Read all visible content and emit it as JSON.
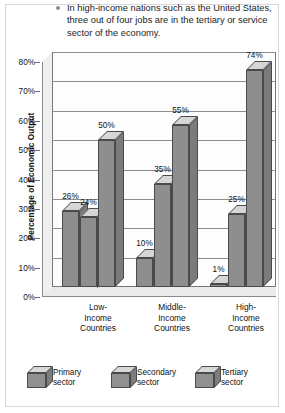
{
  "caption": {
    "bullet_icon": "bullet-dot-icon",
    "text": "In high-income nations such as the United States, three out of four jobs are in the tertiary or service sector of the economy."
  },
  "chart_data": {
    "type": "bar",
    "title": "",
    "xlabel": "",
    "ylabel": "Percentage of Economic Output",
    "ylim": [
      0,
      80
    ],
    "yticks": [
      "0%",
      "10%",
      "20%",
      "30%",
      "40%",
      "50%",
      "60%",
      "70%",
      "80%"
    ],
    "grid": true,
    "legend_position": "bottom",
    "categories": [
      "Low-\nIncome\nCountries",
      "Middle-\nIncome\nCountries",
      "High-\nIncome\nCountries"
    ],
    "category_lines": [
      [
        "Low-",
        "Income",
        "Countries"
      ],
      [
        "Middle-",
        "Income",
        "Countries"
      ],
      [
        "High-",
        "Income",
        "Countries"
      ]
    ],
    "series": [
      {
        "name": "Primary sector",
        "values": [
          26,
          10,
          1
        ],
        "labels": [
          "26%",
          "10%",
          "1%"
        ]
      },
      {
        "name": "Secondary sector",
        "values": [
          24,
          35,
          25
        ],
        "labels": [
          "24%",
          "35%",
          "25%"
        ]
      },
      {
        "name": "Tertiary sector",
        "values": [
          50,
          55,
          74
        ],
        "labels": [
          "50%",
          "55%",
          "74%"
        ]
      }
    ],
    "colors": {
      "bar_front": "#8e8e8e",
      "bar_top": "#d6d6d6",
      "bar_side": "#7b7b7b",
      "bar_edge": "#4a4a4a",
      "plot_background": "#fdfdfd",
      "gridline": "#8d8d8d"
    }
  },
  "legend": {
    "items": [
      {
        "label_line1": "Primary",
        "label_line2": "sector",
        "icon": "cube-icon"
      },
      {
        "label_line1": "Secondary",
        "label_line2": "sector",
        "icon": "cube-icon"
      },
      {
        "label_line1": "Tertiary",
        "label_line2": "sector",
        "icon": "cube-icon"
      }
    ]
  }
}
